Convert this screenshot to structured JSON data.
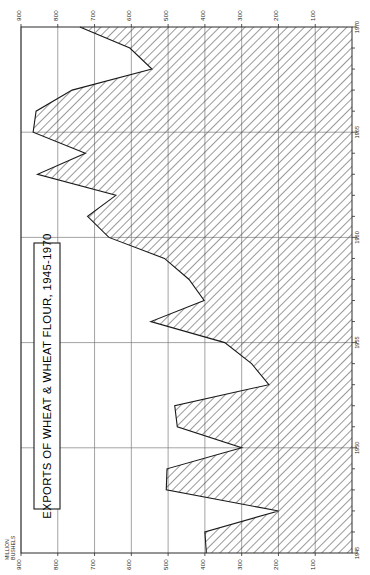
{
  "figure": {
    "title": "EXPORTS OF WHEAT & WHEAT FLOUR, 1945-1970",
    "unit_label_line1": "MILLION",
    "unit_label_line2": "BUSHELS",
    "orientation": "rotated-90",
    "background_color": "#ffffff",
    "line_color": "#1a1a1a",
    "grid_color": "#7d7d7d"
  },
  "axes": {
    "value_axis_title": "MILLION BUSHELS",
    "value_ticks": [
      "900",
      "800",
      "700",
      "600",
      "500",
      "400",
      "300",
      "200",
      "100"
    ],
    "value_tick_numbers": [
      900,
      800,
      700,
      600,
      500,
      400,
      300,
      200,
      100
    ],
    "year_ticks": [
      "1945",
      "1950",
      "1955",
      "1960",
      "1965",
      "1970"
    ],
    "year_tick_numbers": [
      1945,
      1950,
      1955,
      1960,
      1965,
      1970
    ]
  },
  "chart_data": {
    "type": "area",
    "title": "EXPORTS OF WHEAT & WHEAT FLOUR, 1945-1970",
    "xlabel": "",
    "ylabel": "MILLION BUSHELS",
    "ylim": [
      0,
      950
    ],
    "xlim": [
      1945,
      1970
    ],
    "grid": true,
    "legend": "none",
    "orientation": "horizontal-rotated",
    "categories": [
      1945,
      1946,
      1947,
      1948,
      1949,
      1950,
      1951,
      1952,
      1953,
      1954,
      1955,
      1956,
      1957,
      1958,
      1959,
      1960,
      1961,
      1962,
      1963,
      1964,
      1965,
      1966,
      1967,
      1968,
      1969,
      1970
    ],
    "values": [
      396,
      400,
      200,
      505,
      503,
      300,
      475,
      482,
      226,
      273,
      346,
      547,
      402,
      443,
      510,
      661,
      719,
      642,
      855,
      725,
      867,
      859,
      761,
      544,
      604,
      740
    ],
    "series": [
      {
        "name": "Exports of wheat & wheat flour",
        "unit": "million bushels",
        "values": [
          396,
          400,
          200,
          505,
          503,
          300,
          475,
          482,
          226,
          273,
          346,
          547,
          402,
          443,
          510,
          661,
          719,
          642,
          855,
          725,
          867,
          859,
          761,
          544,
          604,
          740
        ]
      }
    ],
    "annotations": []
  }
}
